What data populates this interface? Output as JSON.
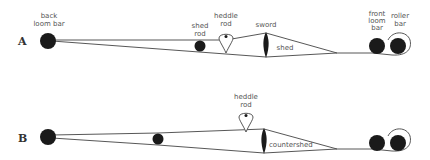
{
  "diagram": {
    "rows": [
      {
        "id": "A",
        "label": "A",
        "labels": {
          "back_loom_bar": [
            "back",
            "loom bar"
          ],
          "shed_rod": [
            "shed",
            "rod"
          ],
          "heddle_rod": [
            "heddle",
            "rod"
          ],
          "sword": "sword",
          "shed": "shed",
          "front_loom_bar": [
            "front",
            "loom",
            "bar"
          ],
          "roller_bar": [
            "roller",
            "bar"
          ]
        }
      },
      {
        "id": "B",
        "label": "B",
        "labels": {
          "heddle_rod": [
            "heddle",
            "rod"
          ],
          "countershed": "countershed"
        }
      }
    ],
    "colors": {
      "ink": "#1a1a1a",
      "line": "#444444",
      "label": "#555555"
    }
  }
}
